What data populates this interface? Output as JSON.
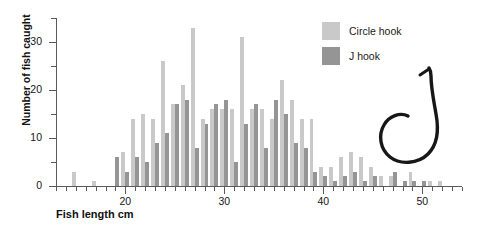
{
  "chart_data": {
    "type": "bar",
    "title": "",
    "xlabel": "Fish length cm",
    "ylabel": "Number of fish caught",
    "xlim": [
      13,
      54
    ],
    "ylim": [
      0,
      35
    ],
    "ytick_labels": [
      "0",
      "10",
      "20",
      "30"
    ],
    "ytick_values": [
      0,
      10,
      20,
      30
    ],
    "yminor_values": [
      5,
      15,
      25,
      35
    ],
    "xtick_labels": [
      "20",
      "30",
      "40",
      "50"
    ],
    "xtick_values": [
      20,
      30,
      40,
      50
    ],
    "grid": false,
    "legend_position": "top-right",
    "categories": [
      13,
      14,
      15,
      16,
      17,
      18,
      19,
      20,
      21,
      22,
      23,
      24,
      25,
      26,
      27,
      28,
      29,
      30,
      31,
      32,
      33,
      34,
      35,
      36,
      37,
      38,
      39,
      40,
      41,
      42,
      43,
      44,
      45,
      46,
      47,
      48,
      49,
      50,
      51,
      52,
      53
    ],
    "series": [
      {
        "name": "Circle hook",
        "color": "#c9c9c9",
        "values": [
          0,
          0,
          3,
          0,
          1,
          0,
          0,
          7,
          14,
          15,
          14,
          26,
          17,
          21,
          33,
          14,
          16,
          16,
          16,
          31,
          16,
          16,
          14,
          22,
          18,
          14,
          14,
          4,
          4,
          6,
          7,
          6,
          4,
          2,
          2,
          0,
          3,
          0,
          1,
          1,
          0
        ]
      },
      {
        "name": "J hook",
        "color": "#959595",
        "values": [
          0,
          0,
          0,
          0,
          0,
          0,
          6,
          3,
          6,
          5,
          9,
          11,
          17,
          18,
          8,
          13,
          17,
          18,
          5,
          13,
          17,
          8,
          18,
          15,
          9,
          8,
          3,
          2,
          1,
          2,
          3,
          1,
          2,
          0,
          3,
          1,
          1,
          1,
          0,
          0,
          0
        ]
      }
    ]
  },
  "legend": {
    "items": [
      {
        "label": "Circle hook",
        "color": "#c9c9c9"
      },
      {
        "label": "J hook",
        "color": "#959595"
      }
    ]
  },
  "illustration": {
    "name": "circle-hook-illustration",
    "color": "#171717"
  }
}
